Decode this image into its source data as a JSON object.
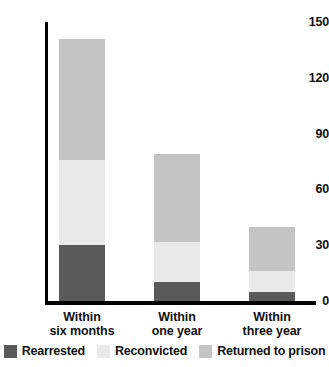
{
  "chart_data": {
    "type": "bar",
    "stacked": true,
    "title": "",
    "subtitle": "",
    "xlabel": "",
    "ylabel": "",
    "ylim": [
      0,
      150
    ],
    "yticks": [
      "0",
      "30",
      "60",
      "90",
      "120",
      "150"
    ],
    "ytick_values": [
      0,
      30,
      60,
      90,
      120,
      150
    ],
    "grid": false,
    "legend_position": "bottom",
    "categories": [
      "Within six months",
      "Within one year",
      "Within three year"
    ],
    "category_lines": [
      {
        "line1": "Within",
        "line2": "six months"
      },
      {
        "line1": "Within",
        "line2": "one year"
      },
      {
        "line1": "Within",
        "line2": "three year"
      }
    ],
    "series": [
      {
        "name": "Rearrested",
        "color": "#5a5a5a",
        "values": [
          30,
          10,
          5
        ]
      },
      {
        "name": "Reconvicted",
        "color": "#e9e9e9",
        "values": [
          46,
          22,
          11
        ]
      },
      {
        "name": "Returned to prison",
        "color": "#c4c4c4",
        "values": [
          65,
          47,
          24
        ]
      }
    ],
    "totals": [
      141,
      79,
      40
    ],
    "axis_color": "#000000",
    "background_color": "#ffffff",
    "text_color": "#111111"
  }
}
